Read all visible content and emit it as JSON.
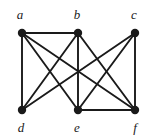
{
  "figure": {
    "name": "undirected-graph-diagram",
    "width": 154,
    "height": 135,
    "background_color": "#ffffff",
    "stroke_color": "#1a1a1a",
    "vertex_fill_color": "#1a1a1a",
    "vertex_radius": 4.2,
    "edge_width": 1.9
  },
  "graph": {
    "type": "undirected",
    "vertex_count": 6,
    "edge_count": 11,
    "vertices": [
      {
        "id": "a",
        "label": "a",
        "x": 22,
        "y": 33,
        "label_x": 20,
        "label_y": 14,
        "row": "top"
      },
      {
        "id": "b",
        "label": "b",
        "x": 78,
        "y": 33,
        "label_x": 77,
        "label_y": 14,
        "row": "top"
      },
      {
        "id": "c",
        "label": "c",
        "x": 135,
        "y": 33,
        "label_x": 134,
        "label_y": 14,
        "row": "top"
      },
      {
        "id": "d",
        "label": "d",
        "x": 22,
        "y": 110,
        "label_x": 21,
        "label_y": 127,
        "row": "bottom"
      },
      {
        "id": "e",
        "label": "e",
        "x": 78,
        "y": 110,
        "label_x": 77,
        "label_y": 127,
        "row": "bottom"
      },
      {
        "id": "f",
        "label": "f",
        "x": 135,
        "y": 110,
        "label_x": 135,
        "label_y": 127,
        "row": "bottom"
      }
    ],
    "edges": [
      {
        "from": "a",
        "to": "b"
      },
      {
        "from": "a",
        "to": "d"
      },
      {
        "from": "a",
        "to": "e"
      },
      {
        "from": "a",
        "to": "f"
      },
      {
        "from": "b",
        "to": "d"
      },
      {
        "from": "b",
        "to": "e"
      },
      {
        "from": "b",
        "to": "f"
      },
      {
        "from": "c",
        "to": "d"
      },
      {
        "from": "c",
        "to": "e"
      },
      {
        "from": "c",
        "to": "f"
      },
      {
        "from": "e",
        "to": "f"
      }
    ]
  }
}
